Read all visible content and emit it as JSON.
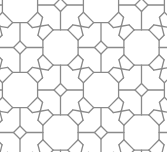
{
  "diagram": {
    "type": "geometric-tiling",
    "stroke_color": "#8a8a8a",
    "background": "#ffffff",
    "lattice": {
      "origin_x": 20,
      "origin_y": 5,
      "step_x": 40.5,
      "step_y": 42.5,
      "cols": 5,
      "rows": 5
    },
    "octagon_radius": 19,
    "square_radius": 6.5,
    "cells_note": "checkerboard: octagon where (col+row) even, square where odd"
  }
}
